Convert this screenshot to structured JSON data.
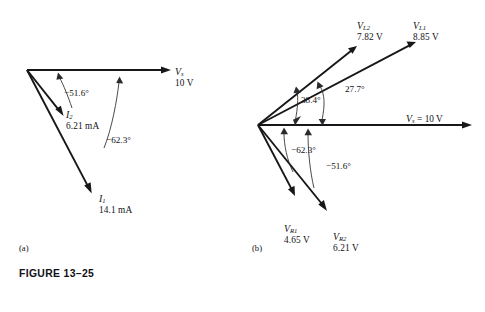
{
  "figure": {
    "caption": "FIGURE 13–25",
    "panel_a_tag": "(a)",
    "panel_b_tag": "(b)"
  },
  "panel_a": {
    "tag": "(a)",
    "vectors": [
      {
        "name": "source-voltage",
        "symbol": "V",
        "subscript": "s",
        "magnitude": "10 V",
        "angle_deg": 0,
        "length_px": 143
      },
      {
        "name": "current-i2",
        "symbol": "I",
        "subscript": "2",
        "magnitude": "6.21 mA",
        "angle_deg": -51.6,
        "length_px": 60
      },
      {
        "name": "current-i1",
        "symbol": "I",
        "subscript": "1",
        "magnitude": "14.1 mA",
        "angle_deg": -62.3,
        "length_px": 140
      }
    ],
    "angles": [
      {
        "name": "angle-i2",
        "label": "−51.6°"
      },
      {
        "name": "angle-i1",
        "label": "−62.3°"
      }
    ]
  },
  "panel_b": {
    "tag": "(b)",
    "vectors": [
      {
        "name": "source-voltage",
        "symbol": "V",
        "subscript": "s",
        "magnitude": "= 10 V",
        "angle_deg": 0,
        "length_px": 214
      },
      {
        "name": "inductor-voltage-vl1",
        "symbol": "V",
        "subscript": "L1",
        "magnitude": "8.85 V",
        "angle_deg": 27.7,
        "length_px": 176
      },
      {
        "name": "inductor-voltage-vl2",
        "symbol": "V",
        "subscript": "L2",
        "magnitude": "7.82 V",
        "angle_deg": 38.4,
        "length_px": 125
      },
      {
        "name": "resistor-voltage-vr1",
        "symbol": "V",
        "subscript": "R1",
        "magnitude": "4.65 V",
        "angle_deg": -62.3,
        "length_px": 80
      },
      {
        "name": "resistor-voltage-vr2",
        "symbol": "V",
        "subscript": "R2",
        "magnitude": "6.21 V",
        "angle_deg": -51.6,
        "length_px": 113
      }
    ],
    "angles": [
      {
        "name": "angle-vl2",
        "label": "38.4°"
      },
      {
        "name": "angle-vl1",
        "label": "27.7°"
      },
      {
        "name": "angle-vr1",
        "label": "−62.3°"
      },
      {
        "name": "angle-vr2",
        "label": "−51.6°"
      }
    ]
  },
  "colors": {
    "ink": "#17171a",
    "arc": "#2a2a2e",
    "background": "#ffffff"
  }
}
